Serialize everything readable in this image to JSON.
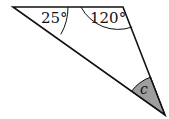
{
  "diagram": {
    "type": "triangle",
    "angles": [
      {
        "vertex": "top-left",
        "label": "25°"
      },
      {
        "vertex": "top-right",
        "label": "120°"
      },
      {
        "vertex": "bottom",
        "label": "c",
        "shaded": true
      }
    ],
    "colors": {
      "stroke": "#111111",
      "shade": "#9e9e9e"
    }
  }
}
